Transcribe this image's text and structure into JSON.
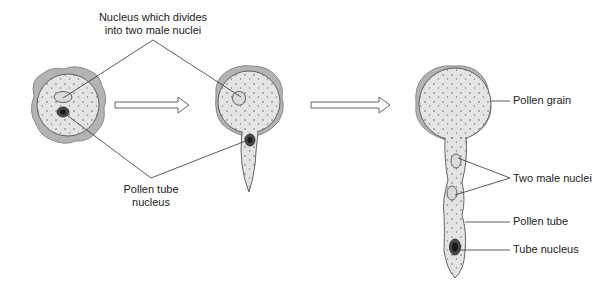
{
  "diagram": {
    "colors": {
      "exine": "#b3b3b3",
      "exine_edge": "#7a7a7a",
      "cytoplasm": "#e4e4e4",
      "outline": "#555555",
      "tube_nucleus": "#4a4a4a",
      "tube_nucleus_core": "#1a1a1a",
      "male_nucleus": "#d8d8d8",
      "leader_line": "#333333",
      "arrow_fill": "#ffffff",
      "arrow_stroke": "#555555"
    },
    "stages": [
      {
        "name": "ungerminated-pollen-grain"
      },
      {
        "name": "germinating-pollen-grain"
      },
      {
        "name": "mature-pollen-tube"
      }
    ],
    "labels": {
      "generative_nucleus": {
        "line1": "Nucleus which divides",
        "line2": "into two male nuclei"
      },
      "tube_nucleus_left": {
        "line1": "Pollen tube",
        "line2": "nucleus"
      },
      "pollen_grain": "Pollen grain",
      "male_nuclei": "Two male nuclei",
      "pollen_tube": "Pollen tube",
      "tube_nucleus": "Tube nucleus"
    }
  }
}
